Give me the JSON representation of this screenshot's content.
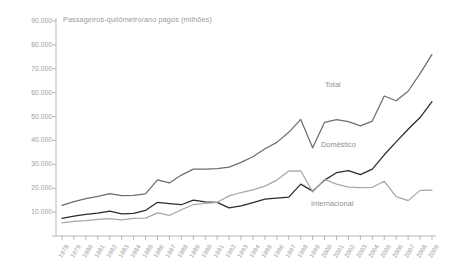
{
  "chart_data": {
    "type": "line",
    "title": "Passageiros-quilômetro/ano pagos (milhões)",
    "xlabel": "",
    "ylabel": "",
    "ylim": [
      0,
      90000
    ],
    "ytick_labels": [
      "90.000",
      "80.000",
      "70.000",
      "60.000",
      "50.000",
      "40.000",
      "30.000",
      "20.000",
      "10.000"
    ],
    "ytick_values": [
      90000,
      80000,
      70000,
      60000,
      50000,
      40000,
      30000,
      20000,
      10000
    ],
    "grid": false,
    "legend_position": "inline-annotations",
    "categories": [
      "1978",
      "1979",
      "1980",
      "1981",
      "1982",
      "1983",
      "1984",
      "1985",
      "1986",
      "1987",
      "1988",
      "1989",
      "1990",
      "1991",
      "1992",
      "1993",
      "1994",
      "1995",
      "1996",
      "1997",
      "1998",
      "1999",
      "2000",
      "2001",
      "2002",
      "2003",
      "2004",
      "2005",
      "2006",
      "2007",
      "2008",
      "2009"
    ],
    "series": [
      {
        "name": "Total",
        "color": "#6e6e6e",
        "values": [
          12800,
          14400,
          15600,
          16600,
          17700,
          16900,
          17000,
          17600,
          23500,
          22200,
          25500,
          28000,
          28000,
          28200,
          28800,
          30800,
          33200,
          36500,
          39200,
          43400,
          48800,
          36900,
          47600,
          48700,
          47900,
          46100,
          48100,
          58600,
          56600,
          60600,
          68000,
          76000
        ]
      },
      {
        "name": "Doméstico",
        "color": "#2b2b2b",
        "values": [
          7400,
          8300,
          9100,
          9600,
          10400,
          9300,
          9500,
          10700,
          14100,
          13600,
          13100,
          15000,
          14300,
          14100,
          11800,
          12600,
          14000,
          15400,
          15900,
          16300,
          21700,
          18800,
          23400,
          26500,
          27400,
          25700,
          28000,
          34000,
          39400,
          44700,
          49600,
          56200
        ]
      },
      {
        "name": "Internacional",
        "color": "#a8a8a8",
        "values": [
          5500,
          6100,
          6400,
          7000,
          7300,
          6700,
          7400,
          7500,
          9700,
          8600,
          11000,
          13100,
          13700,
          14100,
          16800,
          18200,
          19300,
          20900,
          23400,
          27200,
          27300,
          18400,
          23700,
          21700,
          20500,
          20300,
          20400,
          22900,
          16500,
          14800,
          19100,
          19200
        ]
      }
    ]
  },
  "annotations": [
    {
      "name": "total-series-label",
      "text": "Total",
      "x": 325,
      "y": 80
    },
    {
      "name": "domestico-series-label",
      "text": "Doméstico",
      "x": 321,
      "y": 140
    },
    {
      "name": "internacional-series-label",
      "text": "Internacional",
      "x": 311,
      "y": 199
    }
  ],
  "axis": {
    "y_top_px": 21,
    "y_zero_px": 236,
    "x_first_px": 62,
    "x_last_px": 432,
    "axis_color": "#9a9a9a"
  }
}
